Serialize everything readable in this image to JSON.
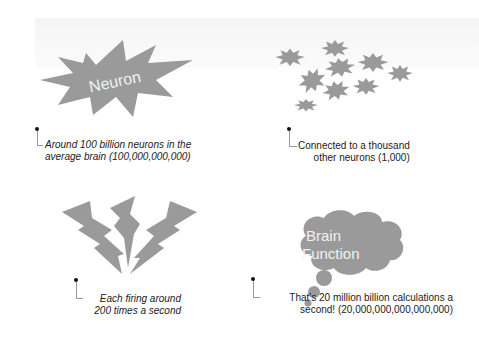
{
  "panels": [
    {
      "id": "neuron",
      "shape_label": "Neuron",
      "caption_line1": "Around 100 billion neurons in the",
      "caption_line2": "average brain (100,000,000,000)"
    },
    {
      "id": "connections",
      "caption_line1": "Connected to a thousand",
      "caption_line2": "other neurons (1,000)"
    },
    {
      "id": "firing",
      "caption_line1": "Each firing around",
      "caption_line2": "200 times a second"
    },
    {
      "id": "brain-function",
      "shape_label_line1": "Brain",
      "shape_label_line2": "Function",
      "caption_line1": "That's 20 million billion calculations a",
      "caption_line2": "second! (20,000,000,000,000,000)"
    }
  ],
  "colors": {
    "shape_fill": "#9a9a9a",
    "shape_text": "#f1f1f1",
    "caption_text": "#222222",
    "leader_line": "#999999"
  }
}
